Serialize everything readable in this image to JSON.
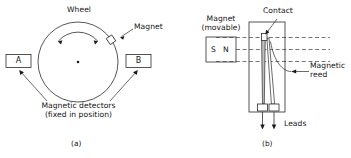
{
  "figure": {
    "panel_a": {
      "caption": "(a)",
      "wheel_label": "Wheel",
      "magnet_label": "Magnet",
      "detector_a_label": "A",
      "detector_b_label": "B",
      "detectors_caption_line1": "Magnetic detectors",
      "detectors_caption_line2": "(fixed in position)"
    },
    "panel_b": {
      "caption": "(b)",
      "magnet_label_line1": "Magnet",
      "magnet_label_line2": "(movable)",
      "pole_south": "S",
      "pole_north": "N",
      "contact_label": "Contact",
      "reed_label_line1": "Magnetic",
      "reed_label_line2": "reed",
      "leads_label": "Leads"
    },
    "colors": {
      "line": "#2b2b2b",
      "dashed": "#3a3a3a",
      "fill": "#ffffff",
      "reed_fill": "#bfbfbf",
      "background": "#ffffff",
      "text": "#141414"
    }
  }
}
